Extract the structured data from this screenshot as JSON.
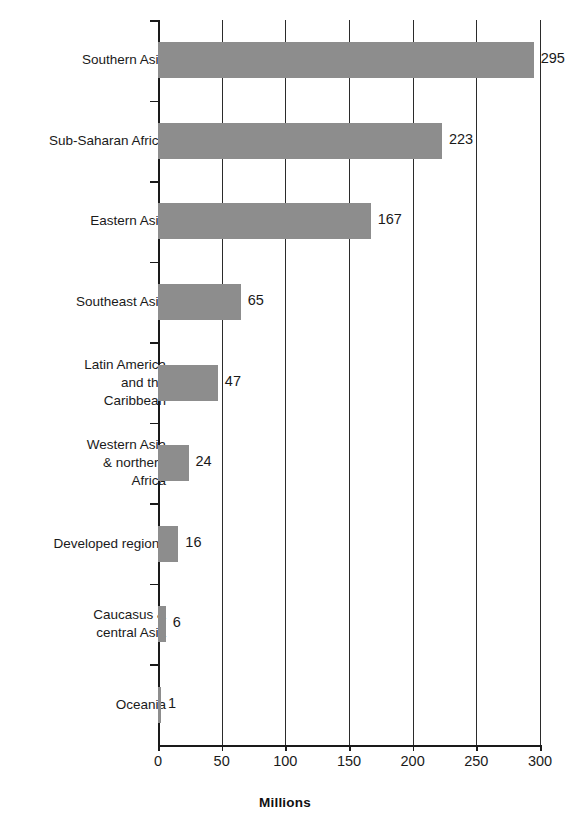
{
  "chart_data": {
    "type": "bar",
    "orientation": "horizontal",
    "title": "",
    "xlabel": "Millions",
    "ylabel": "",
    "xlim": [
      0,
      300
    ],
    "xticks": [
      0,
      50,
      100,
      150,
      200,
      250,
      300
    ],
    "xtick_labels": [
      "0",
      "50",
      "100",
      "150",
      "200",
      "250",
      "300"
    ],
    "grid": true,
    "grid_axis": "x",
    "legend": false,
    "bar_color": "#8d8d8d",
    "categories": [
      "Southern Asia",
      "Sub-Saharan Africa",
      "Eastern Asia",
      "Southeast Asia",
      "Latin America and the Caribbean",
      "Western Asia & northern Africa",
      "Developed regions",
      "Caucasus & central Asia",
      "Oceania"
    ],
    "values": [
      295,
      223,
      167,
      65,
      47,
      24,
      16,
      6,
      1
    ],
    "data_labels": [
      "295",
      "223",
      "167",
      "65",
      "47",
      "24",
      "16",
      "6",
      "1"
    ],
    "category_label_lines": [
      [
        "Southern Asia"
      ],
      [
        "Sub-Saharan Africa"
      ],
      [
        "Eastern Asia"
      ],
      [
        "Southeast Asia"
      ],
      [
        "Latin America",
        "and the",
        "Caribbean"
      ],
      [
        "Western Asia",
        "& northern",
        "Africa"
      ],
      [
        "Developed regions"
      ],
      [
        "Caucasus &",
        "central Asia"
      ],
      [
        "Oceania"
      ]
    ]
  }
}
